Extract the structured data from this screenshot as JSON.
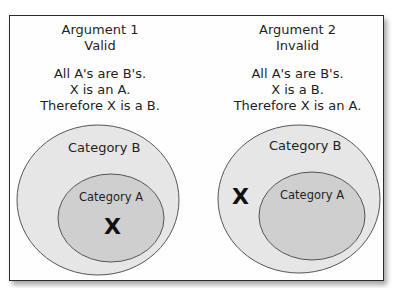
{
  "arguments": [
    {
      "title": "Argument 1",
      "verdict": "Valid",
      "premises": [
        "All A's are B's.",
        "X is an A.",
        "Therefore X is a B."
      ],
      "outer_label": "Category B",
      "inner_label": "Category A",
      "x_marker": "X",
      "x_position": "inside Category A"
    },
    {
      "title": "Argument 2",
      "verdict": "Invalid",
      "premises": [
        "All A's are B's.",
        "X is a B.",
        "Therefore X is an A."
      ],
      "outer_label": "Category B",
      "inner_label": "Category A",
      "x_marker": "X",
      "x_position": "inside Category B, outside Category A"
    }
  ],
  "colors": {
    "outer_fill": "#e6e6e6",
    "inner_fill": "#cfcfcf",
    "stroke": "#555555",
    "frame_border": "#2a2a2a"
  }
}
